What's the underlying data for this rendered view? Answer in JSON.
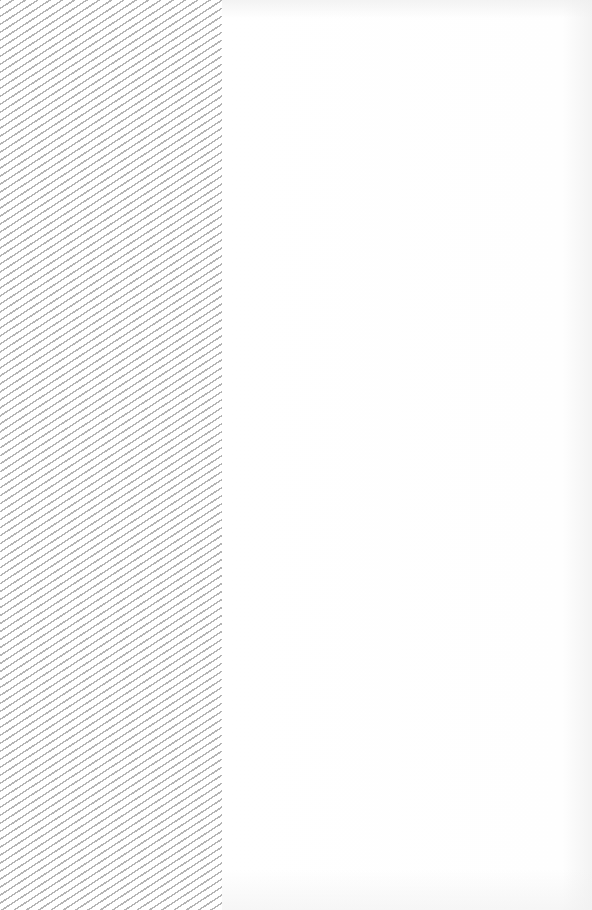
{
  "layout": {
    "placeholder_panel": {
      "width_px": 222,
      "pattern": "diagonal-hatch",
      "stripe_color": "#b4b4b4",
      "background_color": "#ffffff"
    },
    "content_area": {
      "background_color": "#fefefe",
      "text": ""
    }
  },
  "colors": {
    "hatch": "#b4b4b4",
    "background": "#ffffff",
    "edge_shade": "#f3f3f3"
  }
}
